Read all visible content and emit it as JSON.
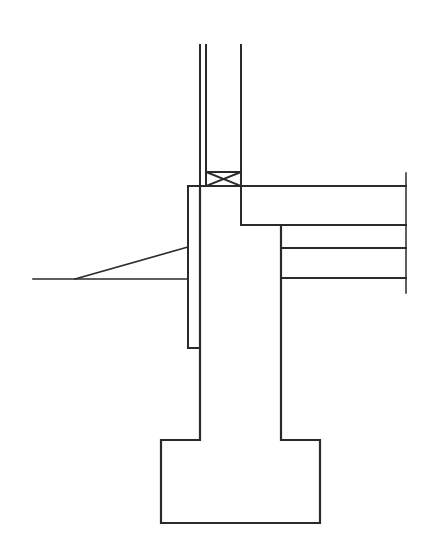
{
  "diagram": {
    "type": "architectural-section",
    "stroke_color": "#2a2a2a",
    "background": "#ffffff",
    "labels": []
  }
}
